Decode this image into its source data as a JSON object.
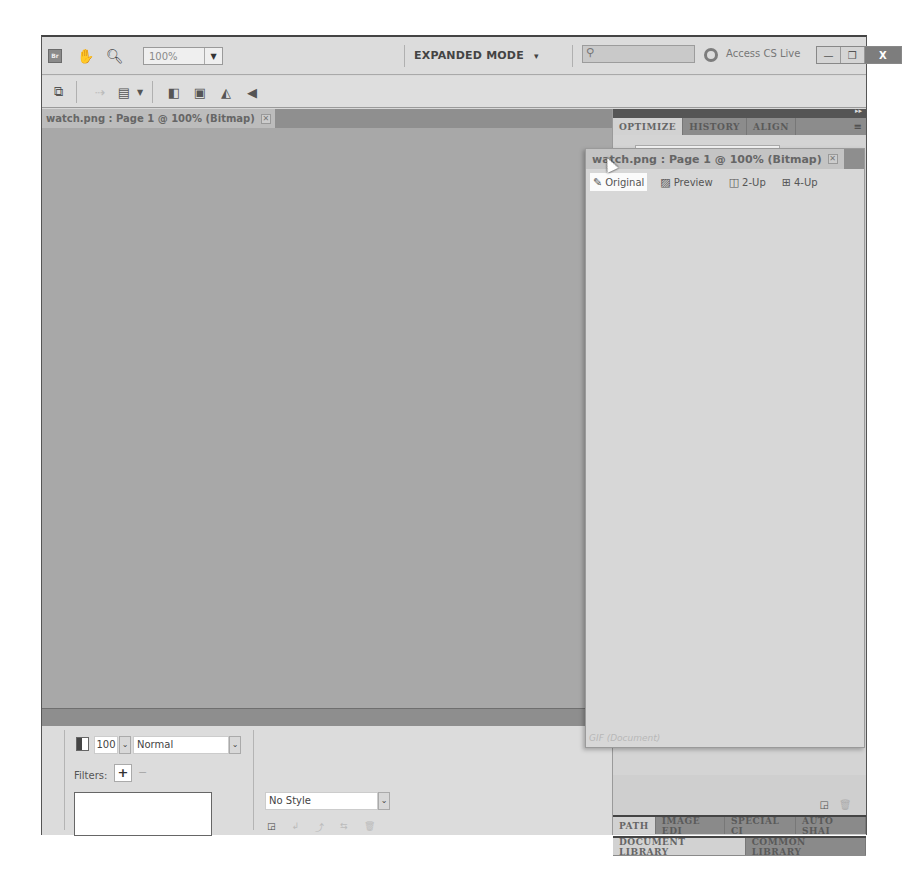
{
  "appbar": {
    "logo": "Br",
    "zoom_value": "100%",
    "mode_label": "EXPANDED MODE",
    "mode_arrow": "▾",
    "search_placeholder": "",
    "cs_live_label": "Access CS Live",
    "window_controls": {
      "minimize": "—",
      "restore": "❐",
      "close": "X"
    }
  },
  "document": {
    "tab_label": "watch.png : Page 1 @ 100% (Bitmap)",
    "tab_close": "✕"
  },
  "properties": {
    "opacity_value": "100",
    "blend_mode": "Normal",
    "filters_label": "Filters:",
    "filters_add": "+",
    "filters_remove": "−",
    "style_value": "No Style",
    "dropdown_arrow": "⌄"
  },
  "right_panel": {
    "top_tabs": [
      {
        "label": "OPTIMIZE",
        "active": true
      },
      {
        "label": "HISTORY",
        "active": false
      },
      {
        "label": "ALIGN",
        "active": false
      }
    ],
    "collapse_glyph": "▸▸",
    "menu_glyph": "≡",
    "middle_tabs": [
      {
        "label": "PATH",
        "active": true
      },
      {
        "label": "IMAGE EDI",
        "active": false
      },
      {
        "label": "SPECIAL CI",
        "active": false
      },
      {
        "label": "AUTO SHAI",
        "active": false
      }
    ],
    "bottom_tabs": [
      {
        "label": "DOCUMENT LIBRARY",
        "active": true
      },
      {
        "label": "COMMON LIBRARY",
        "active": false
      }
    ]
  },
  "floating_window": {
    "tab_label": "watch.png : Page 1 @ 100% (Bitmap)",
    "tab_close": "✕",
    "views": [
      {
        "label": "Original",
        "icon": "pencil-icon",
        "active": true
      },
      {
        "label": "Preview",
        "icon": "image-icon",
        "active": false
      },
      {
        "label": "2-Up",
        "icon": "two-up-icon",
        "active": false
      },
      {
        "label": "4-Up",
        "icon": "four-up-icon",
        "active": false
      }
    ],
    "status": "GIF (Document)"
  }
}
